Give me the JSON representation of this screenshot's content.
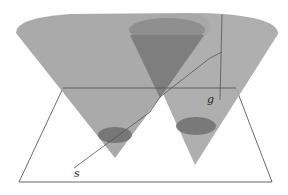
{
  "figure": {
    "labels": {
      "g": "g",
      "s": "s"
    },
    "colors": {
      "cone_fill": "#9a9a9a",
      "cone_inner_fill": "#7d7d7d",
      "section_fill": "#6f6f6f",
      "line": "#555555",
      "plane_edge": "#444444"
    }
  }
}
